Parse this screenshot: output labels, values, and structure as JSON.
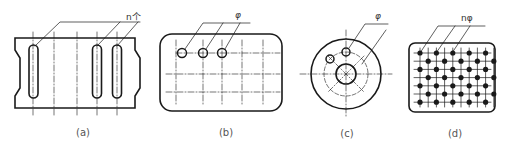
{
  "figure": {
    "panels": [
      {
        "id": "a",
        "caption": "(a)",
        "annotation": "n个",
        "description": "Plate with notched sides and three elongated slots"
      },
      {
        "id": "b",
        "caption": "(b)",
        "annotation": "φ",
        "description": "Rounded rectangle with three holes on a grid of centerlines"
      },
      {
        "id": "c",
        "caption": "(c)",
        "annotation": "φ",
        "description": "Circular flange with central bore and holes on a pitch circle"
      },
      {
        "id": "d",
        "caption": "(d)",
        "annotation": "nφ",
        "description": "Rounded rectangle with staggered hole array"
      }
    ]
  },
  "colors": {
    "line": "#1a1a1a",
    "center": "#333333",
    "caption": "#555555"
  }
}
